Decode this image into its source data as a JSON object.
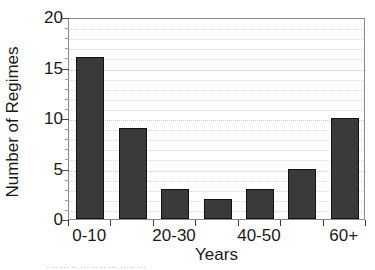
{
  "chart_data": {
    "type": "bar",
    "title": "",
    "xlabel": "Years",
    "ylabel": "Number of Regimes",
    "categories": [
      "0-10",
      "10-20",
      "20-30",
      "30-40",
      "40-50",
      "50-60",
      "60+"
    ],
    "visible_tick_labels": [
      "0-10",
      "",
      "20-30",
      "",
      "40-50",
      "",
      "60+"
    ],
    "values": [
      16,
      9,
      3,
      2,
      3,
      5,
      10
    ],
    "ylim": [
      0,
      20
    ],
    "ytick_labels": [
      "20",
      "15",
      "10",
      "5",
      "0"
    ],
    "ytick_values": [
      20,
      15,
      10,
      5,
      0
    ],
    "ytick_step": 5,
    "minor_gridline_step": 1,
    "grid": true,
    "grid_axis": "y",
    "grid_style": "dotted",
    "legend": null,
    "bar_color": "#3a3a3a",
    "bar_edge_color": "#121212",
    "frame_color": "#8a8a8a",
    "gridline_color": "#d8d8d8",
    "background_color": "#ffffff"
  },
  "caption_remnant": "· ·· ··· ·· ··· ·· ·· ··· ··  ·· ···"
}
